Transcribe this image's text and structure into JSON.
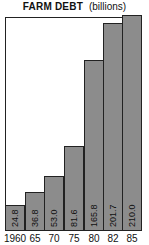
{
  "chart_data": {
    "type": "bar",
    "title": "FARM DEBT",
    "subtitle": "(billions)",
    "categories": [
      "1960",
      "65",
      "70",
      "75",
      "80",
      "82",
      "85"
    ],
    "values": [
      24.8,
      36.8,
      53.0,
      81.6,
      165.8,
      201.7,
      210.0
    ],
    "value_labels": [
      "24.8",
      "36.8",
      "53.0",
      "81.6",
      "165.8",
      "201.7",
      "210.0"
    ],
    "xlabel": "",
    "ylabel": "",
    "ylim": [
      0,
      205
    ],
    "grid": false,
    "legend": "none",
    "bar_color": "#8c8c8c",
    "label_orientation": "vertical-inside-bar"
  },
  "header": {
    "title": "FARM DEBT",
    "unit": "(billions)"
  }
}
